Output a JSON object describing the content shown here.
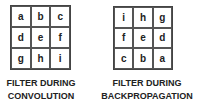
{
  "left_filter": {
    "cells": [
      "a",
      "b",
      "c",
      "d",
      "e",
      "f",
      "g",
      "h",
      "i"
    ],
    "caption_line1": "FILTER DURING",
    "caption_line2": "CONVOLUTION"
  },
  "right_filter": {
    "cells": [
      "i",
      "h",
      "g",
      "f",
      "e",
      "d",
      "c",
      "b",
      "a"
    ],
    "caption_line1": "FILTER DURING",
    "caption_line2": "BACKPROPAGATION"
  }
}
